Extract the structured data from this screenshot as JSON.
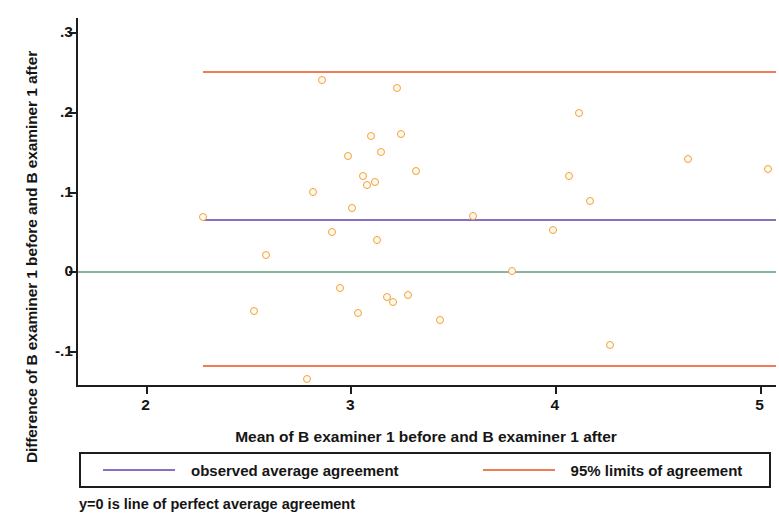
{
  "chart_data": {
    "type": "scatter",
    "title": "",
    "xlabel": "Mean of B examiner 1 before and B examiner 1 after",
    "ylabel": "Difference of B examiner 1 before and B examiner 1 after",
    "xlim": [
      1.67,
      5.09
    ],
    "ylim": [
      -0.145,
      0.318
    ],
    "xticks": [
      2,
      3,
      4,
      5
    ],
    "xticklabels": [
      "2",
      "3",
      "4",
      "5"
    ],
    "yticks": [
      0.3,
      0.2,
      0.1,
      0,
      -0.1
    ],
    "yticklabels": [
      ".3",
      ".2",
      ".1",
      "0",
      "-.1"
    ],
    "grid": false,
    "legend_position": "below-axes",
    "marker": {
      "shape": "circle-open",
      "color": "#f0a23c",
      "size": 8
    },
    "series": [
      {
        "name": "differences",
        "x": [
          2.28,
          2.53,
          2.59,
          2.79,
          2.82,
          2.86,
          2.91,
          2.95,
          2.99,
          3.01,
          3.04,
          3.06,
          3.08,
          3.1,
          3.12,
          3.13,
          3.15,
          3.18,
          3.21,
          3.23,
          3.25,
          3.28,
          3.32,
          3.44,
          3.6,
          3.79,
          3.99,
          4.07,
          4.12,
          4.17,
          4.27,
          4.65,
          5.04
        ],
        "y": [
          0.068,
          -0.05,
          0.02,
          -0.135,
          0.1,
          0.24,
          0.05,
          -0.021,
          0.145,
          0.08,
          -0.052,
          0.12,
          0.108,
          0.17,
          0.112,
          0.04,
          0.15,
          -0.032,
          -0.038,
          0.23,
          0.172,
          -0.03,
          0.126,
          -0.061,
          0.069,
          0.0,
          0.052,
          0.12,
          0.199,
          0.089,
          -0.092,
          0.141,
          0.128
        ]
      }
    ],
    "reference_lines": [
      {
        "name": "upper-limit-of-agreement",
        "y": 0.251,
        "color": "#f07b55",
        "label": "95% limits of agreement"
      },
      {
        "name": "observed-average-agreement",
        "y": 0.066,
        "color": "#8b6fc4",
        "label": "observed average agreement"
      },
      {
        "name": "perfect-average-agreement",
        "y": 0.0,
        "color": "#86b79a",
        "label": "y=0 is line of perfect average agreement"
      },
      {
        "name": "lower-limit-of-agreement",
        "y": -0.118,
        "color": "#f07b55",
        "label": "95% limits of agreement"
      }
    ]
  },
  "legend": {
    "items": [
      {
        "label": "observed average agreement",
        "color": "#8b6fc4",
        "key": "mean"
      },
      {
        "label": "95% limits of agreement",
        "color": "#f07b55",
        "key": "limit"
      }
    ]
  },
  "footnote": "y=0 is line of perfect average agreement"
}
